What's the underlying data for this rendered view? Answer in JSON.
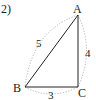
{
  "problem": {
    "number_label": "2)"
  },
  "triangle": {
    "vertices": {
      "A": {
        "label": "A",
        "x": 78,
        "y": 15
      },
      "B": {
        "label": "B",
        "x": 25,
        "y": 87
      },
      "C": {
        "label": "C",
        "x": 78,
        "y": 87
      }
    },
    "sides": {
      "AB": {
        "length_label": "5"
      },
      "AC": {
        "length_label": "4"
      },
      "BC": {
        "length_label": "3"
      }
    },
    "right_angle_at": "C"
  },
  "colors": {
    "line": "#222222",
    "dotted_arc": "#aaaaaa",
    "text": "#222222"
  }
}
